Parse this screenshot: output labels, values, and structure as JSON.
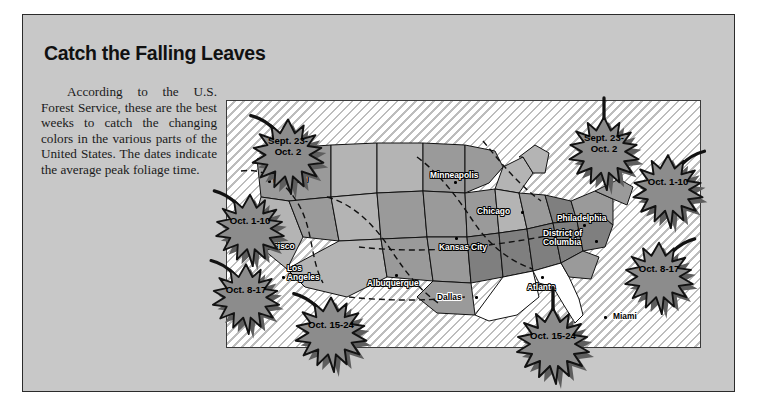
{
  "panel": {
    "headline": "Catch the Falling Leaves",
    "body": "According to the U.S. Forest Service, these are the best weeks to catch the changing colors in the various parts of the United States. The dates indicate the average peak foliage time.",
    "background_color": "#c8c8c8",
    "border_color": "#2b2b2b"
  },
  "map": {
    "frame_border_color": "#3a3a3a",
    "ocean_fill": "#ffffff",
    "hatch_color": "#bdbdbd",
    "state_fill_light": "#b4b4b4",
    "state_fill_mid": "#9a9a9a",
    "state_fill_dark": "#7f7f7f",
    "state_fill_white": "#ffffff",
    "state_border_color": "#111111",
    "zone_line_style": "dashed",
    "cities": [
      {
        "name": "Portland",
        "x": 47,
        "y": 74,
        "dot_dx": -6,
        "dot_dy": 5,
        "style": "dark"
      },
      {
        "name": "San\nFrancisco",
        "x": 28,
        "y": 132,
        "dot_dx": -5,
        "dot_dy": 12,
        "style": "dark"
      },
      {
        "name": "Los\nAngeles",
        "x": 60,
        "y": 163,
        "dot_dx": -5,
        "dot_dy": 12,
        "style": "dark"
      },
      {
        "name": "Albuquerque",
        "x": 140,
        "y": 178,
        "dot_dx": 28,
        "dot_dy": -5,
        "style": "dark"
      },
      {
        "name": "Minneapolis",
        "x": 203,
        "y": 70,
        "dot_dx": 24,
        "dot_dy": 10,
        "style": "dark"
      },
      {
        "name": "Chicago",
        "x": 250,
        "y": 106,
        "dot_dx": 44,
        "dot_dy": 4,
        "style": "dark"
      },
      {
        "name": "Kansas City",
        "x": 212,
        "y": 142,
        "dot_dx": 16,
        "dot_dy": -6,
        "style": "dark"
      },
      {
        "name": "Dallas",
        "x": 210,
        "y": 192,
        "dot_dx": 38,
        "dot_dy": 3,
        "style": "light"
      },
      {
        "name": "Atlanta",
        "x": 300,
        "y": 182,
        "dot_dx": 14,
        "dot_dy": -7,
        "style": "dark"
      },
      {
        "name": "Philadelphia",
        "x": 330,
        "y": 113,
        "dot_dx": 26,
        "dot_dy": 10,
        "style": "dark"
      },
      {
        "name": "District of\nColumbia",
        "x": 316,
        "y": 128,
        "dot_dx": 52,
        "dot_dy": 11,
        "style": "dark"
      },
      {
        "name": "Miami",
        "x": 386,
        "y": 211,
        "dot_dx": -9,
        "dot_dy": 4,
        "style": "light"
      }
    ]
  },
  "leaves": [
    {
      "id": "pacific-northwest",
      "label": "Sept. 23-\nOct. 2",
      "x": 232,
      "y": 98,
      "w": 112,
      "h": 98,
      "stem": "up-left"
    },
    {
      "id": "northern-rockies",
      "label": "Oct. 1-10",
      "x": 196,
      "y": 174,
      "w": 108,
      "h": 94,
      "stem": "up-left"
    },
    {
      "id": "pacific-southwest",
      "label": "Oct. 8-17",
      "x": 192,
      "y": 244,
      "w": 108,
      "h": 92,
      "stem": "up-left"
    },
    {
      "id": "southwest",
      "label": "Oct. 15-24",
      "x": 272,
      "y": 276,
      "w": 118,
      "h": 98,
      "stem": "up-left"
    },
    {
      "id": "northeast-upper",
      "label": "Sept. 23-\nOct. 2",
      "x": 548,
      "y": 96,
      "w": 112,
      "h": 96,
      "stem": "up"
    },
    {
      "id": "new-england",
      "label": "Oct. 1-10",
      "x": 612,
      "y": 134,
      "w": 112,
      "h": 96,
      "stem": "up-right"
    },
    {
      "id": "mid-atlantic",
      "label": "Oct. 8-17",
      "x": 604,
      "y": 222,
      "w": 110,
      "h": 94,
      "stem": "up-right"
    },
    {
      "id": "southeast",
      "label": "Oct. 15-24",
      "x": 494,
      "y": 286,
      "w": 118,
      "h": 100,
      "stem": "up"
    }
  ],
  "leaf_style": {
    "fill": "#8c8c8c",
    "stroke": "#121212",
    "shadow": "#5e5e5e"
  }
}
